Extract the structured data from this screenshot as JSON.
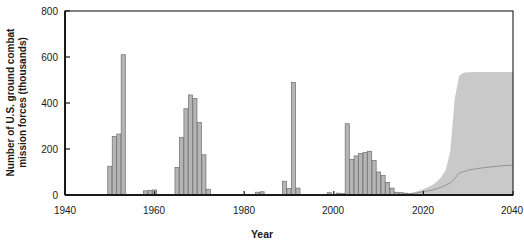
{
  "chart_data": {
    "type": "bar",
    "title": "",
    "xlabel": "Year",
    "ylabel": "Number of U.S. ground combat\nmission forces (thousands)",
    "xlim": [
      1940,
      2040
    ],
    "ylim": [
      0,
      800
    ],
    "xticks": [
      1940,
      1960,
      1980,
      2000,
      2020,
      2040
    ],
    "yticks": [
      0,
      200,
      400,
      600,
      800
    ],
    "grid": false,
    "legend": false,
    "colors": {
      "bar_fill": "#b5b5b5",
      "bar_edge": "#6e6e6e",
      "band_fill": "#c9c9c9",
      "median_line": "#8c8c8c",
      "axis": "#1a1a1a"
    },
    "series": [
      {
        "name": "Historical U.S. ground combat mission forces",
        "type": "bar",
        "x": [
          1950,
          1951,
          1952,
          1953,
          1958,
          1959,
          1960,
          1965,
          1966,
          1967,
          1968,
          1969,
          1970,
          1971,
          1972,
          1983,
          1984,
          1989,
          1990,
          1991,
          1992,
          1999,
          2001,
          2002,
          2003,
          2004,
          2005,
          2006,
          2007,
          2008,
          2009,
          2010,
          2011,
          2012,
          2013,
          2014,
          2015,
          2016
        ],
        "values": [
          125,
          255,
          265,
          610,
          18,
          20,
          22,
          120,
          250,
          375,
          435,
          420,
          315,
          175,
          25,
          12,
          14,
          60,
          28,
          490,
          30,
          10,
          8,
          6,
          310,
          155,
          170,
          180,
          185,
          190,
          150,
          100,
          85,
          55,
          30,
          12,
          10,
          8
        ]
      },
      {
        "name": "Projection uncertainty band (90% range)",
        "type": "area",
        "x": [
          2016,
          2017,
          2018,
          2019,
          2020,
          2021,
          2022,
          2023,
          2024,
          2025,
          2026,
          2027,
          2028,
          2029,
          2030,
          2032,
          2034,
          2036,
          2038,
          2040
        ],
        "upper": [
          6,
          8,
          12,
          18,
          26,
          34,
          44,
          58,
          78,
          110,
          190,
          420,
          520,
          532,
          534,
          535,
          535,
          535,
          535,
          535
        ],
        "lower": [
          0,
          0,
          0,
          0,
          0,
          0,
          0,
          0,
          0,
          0,
          0,
          0,
          0,
          0,
          0,
          0,
          0,
          0,
          0,
          0
        ]
      },
      {
        "name": "Projected median",
        "type": "line",
        "x": [
          2016,
          2018,
          2020,
          2022,
          2024,
          2026,
          2027,
          2028,
          2030,
          2032,
          2034,
          2036,
          2038,
          2040
        ],
        "values": [
          4,
          8,
          14,
          22,
          34,
          52,
          72,
          95,
          108,
          115,
          120,
          124,
          128,
          130
        ]
      }
    ]
  }
}
